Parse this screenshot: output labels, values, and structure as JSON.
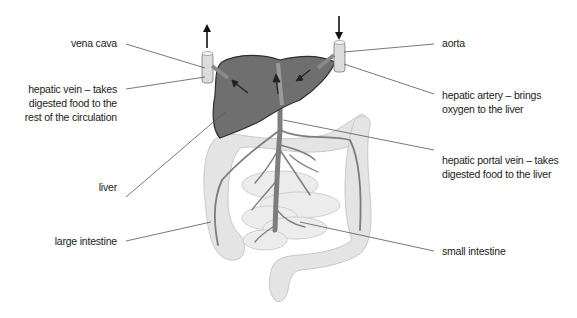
{
  "diagram": {
    "type": "anatomy",
    "colors": {
      "liver": "#6f6f6f",
      "liver_outline": "#2e2e2e",
      "vessel": "#7d7d7d",
      "intestine_fill": "#e4e4e4",
      "intestine_outline": "#c9c9c9",
      "tube_fill": "#dcdcdc",
      "leader_line": "#555555",
      "text": "#222222"
    },
    "labels": {
      "vena_cava": "vena cava",
      "hepatic_vein_1": "hepatic vein – takes",
      "hepatic_vein_2": "digested food to the",
      "hepatic_vein_3": "rest of the circulation",
      "liver": "liver",
      "large_intestine": "large intestine",
      "aorta": "aorta",
      "hepatic_artery_1": "hepatic artery – brings",
      "hepatic_artery_2": "oxygen to the liver",
      "hepatic_portal_vein_1": "hepatic portal vein – takes",
      "hepatic_portal_vein_2": "digested food to the liver",
      "small_intestine": "small intestine"
    },
    "arrows": {
      "vena_cava_flow": "up",
      "aorta_flow": "down"
    }
  }
}
